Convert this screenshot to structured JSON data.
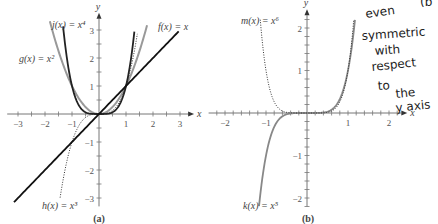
{
  "chart_data": [
    {
      "type": "line",
      "panel_label": "(a)",
      "xlabel": "x",
      "ylabel": "y",
      "xlim": [
        -3.3,
        3.3
      ],
      "ylim": [
        -3.3,
        3.3
      ],
      "x_ticks": [
        "-3",
        "-2",
        "-1",
        "1",
        "2",
        "3"
      ],
      "y_ticks": [
        "-3",
        "-2",
        "-1",
        "1",
        "2",
        "3"
      ],
      "grid": false,
      "series": [
        {
          "name": "f(x) = x",
          "label": "f(x) = x",
          "style": "solid-black",
          "x": [
            -3,
            0,
            3
          ],
          "y": [
            -3,
            0,
            3
          ]
        },
        {
          "name": "g(x) = x^2",
          "label": "g(x) = x²",
          "style": "solid-gray",
          "x": [
            -1.8,
            -1,
            0,
            1,
            1.8
          ],
          "y": [
            3.24,
            1,
            0,
            1,
            3.24
          ]
        },
        {
          "name": "h(x) = x^3",
          "label": "h(x) = x³",
          "style": "dotted",
          "x": [
            -1.44,
            -1,
            0,
            1,
            1.44
          ],
          "y": [
            -3,
            -1,
            0,
            1,
            3
          ]
        },
        {
          "name": "j(x) = x^4",
          "label": "j(x) = x⁴",
          "style": "solid-dark",
          "x": [
            -1.32,
            -1,
            0,
            1,
            1.32
          ],
          "y": [
            3,
            1,
            0,
            1,
            3
          ]
        }
      ]
    },
    {
      "type": "line",
      "panel_label": "(b)",
      "xlabel": "x",
      "ylabel": "y",
      "xlim": [
        -2.2,
        2.2
      ],
      "ylim": [
        -2.2,
        2.2
      ],
      "x_ticks": [
        "-2",
        "-1",
        "1",
        "2"
      ],
      "y_ticks": [
        "-2",
        "-1",
        "1",
        "2"
      ],
      "grid": false,
      "series": [
        {
          "name": "k(x) = x^5",
          "label": "k(x) = x⁵",
          "style": "solid-gray",
          "x": [
            -1.17,
            -1,
            0,
            1,
            1.17
          ],
          "y": [
            -2.2,
            -1,
            0,
            1,
            2.2
          ]
        },
        {
          "name": "m(x) = x^6",
          "label": "m(x) = x⁶",
          "style": "dotted",
          "x": [
            -1.14,
            -1,
            0,
            1,
            1.14
          ],
          "y": [
            2.2,
            1,
            0,
            1,
            2.2
          ]
        }
      ]
    }
  ],
  "annotation": {
    "handwritten_lines": [
      "even",
      "symmetric",
      "with",
      "respect",
      "to",
      "the",
      "y axis"
    ],
    "corner_fragment": "(b"
  }
}
